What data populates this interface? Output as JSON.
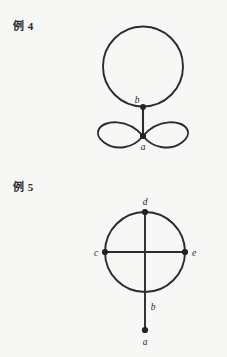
{
  "page": {
    "background_color": "#f7f7f5",
    "ink_color": "#2b2b2b"
  },
  "figures": [
    {
      "id": "example-4",
      "label": "例 4",
      "caption_label_kanji": "例",
      "caption_number": "4",
      "description": "Graph with a circle loop attached at vertex b, a bridge edge from b down to vertex a, and a figure-eight pair of loops at vertex a",
      "vertices": [
        {
          "name": "b",
          "label": "b",
          "x": 143,
          "y": 107,
          "label_x": 138,
          "label_y": 102
        },
        {
          "name": "a",
          "label": "a",
          "x": 143,
          "y": 136,
          "label_x": 143,
          "label_y": 150
        }
      ],
      "edges": [
        {
          "type": "loop",
          "at": "b",
          "shape": "large-circle"
        },
        {
          "type": "bridge",
          "from": "b",
          "to": "a"
        },
        {
          "type": "loop",
          "at": "a",
          "shape": "left-petal"
        },
        {
          "type": "loop",
          "at": "a",
          "shape": "right-petal"
        }
      ]
    },
    {
      "id": "example-5",
      "label": "例 5",
      "caption_label_kanji": "例",
      "caption_number": "5",
      "description": "Circle with vertical and horizontal diameters meeting at the center, vertices d top, b bottom, c left, e right, plus a pendant edge from b down to a",
      "vertices": [
        {
          "name": "d",
          "label": "d",
          "x": 145,
          "y": 212,
          "label_x": 145,
          "label_y": 204
        },
        {
          "name": "c",
          "label": "c",
          "x": 105,
          "y": 252,
          "label_x": 95,
          "label_y": 256
        },
        {
          "name": "e",
          "label": "e",
          "x": 185,
          "y": 252,
          "label_x": 195,
          "label_y": 256
        },
        {
          "name": "b",
          "label": "b",
          "x": 145,
          "y": 292,
          "label_x": 153,
          "label_y": 308
        },
        {
          "name": "a",
          "label": "a",
          "x": 145,
          "y": 330,
          "label_x": 145,
          "label_y": 345
        }
      ],
      "edges": [
        {
          "type": "arc",
          "from": "d",
          "to": "c"
        },
        {
          "type": "arc",
          "from": "c",
          "to": "b"
        },
        {
          "type": "arc",
          "from": "b",
          "to": "e"
        },
        {
          "type": "arc",
          "from": "e",
          "to": "d"
        },
        {
          "type": "chord",
          "from": "d",
          "to": "b"
        },
        {
          "type": "chord",
          "from": "c",
          "to": "e"
        },
        {
          "type": "pendant",
          "from": "b",
          "to": "a"
        }
      ]
    }
  ]
}
